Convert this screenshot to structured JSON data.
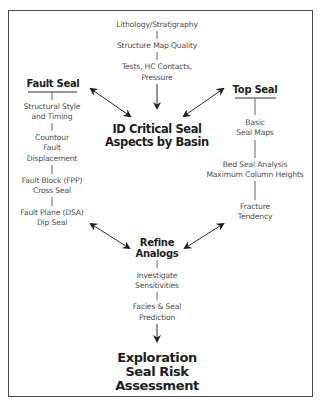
{
  "diagram": {
    "top_inputs": [
      "Lithology/Stratigraphy",
      "Structure Map Quality",
      "Tests, HC Contacts,",
      "Pressure"
    ],
    "center_node": {
      "line1": "ID Critical Seal",
      "line2": "Aspects by Basin"
    },
    "fault_seal": {
      "heading": "Fault Seal",
      "items": [
        [
          "Structural Style",
          "and Timing"
        ],
        [
          "Countour",
          "Fault",
          "Displacement"
        ],
        [
          "Fault Block (FPP)",
          "Cross Seal"
        ],
        [
          "Fault Plane (DSA)",
          "Dip Seal"
        ]
      ]
    },
    "top_seal": {
      "heading": "Top Seal",
      "items": [
        [
          "Basic",
          "Seal Maps"
        ],
        [
          "Bed Seal Analysis",
          "Maximum Column Heights"
        ],
        [
          "Fracture",
          "Tendency"
        ]
      ]
    },
    "refine_node": {
      "line1": "Refine",
      "line2": "Analogs"
    },
    "refine_steps": [
      [
        "Investigate",
        "Sensitivities"
      ],
      [
        "Facies & Seal",
        "Prediction"
      ]
    ],
    "final_node": {
      "line1": "Exploration",
      "line2": "Seal Risk",
      "line3": "Assessment"
    },
    "colors": {
      "frame": "#4a4a4a",
      "text": "#4d4d4d",
      "heading": "#1e1e1e",
      "arrow": "#2a2a2a"
    }
  }
}
